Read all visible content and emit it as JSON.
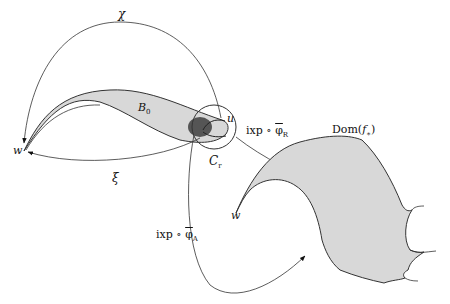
{
  "diagram": {
    "labels": {
      "chi": "χ",
      "xi": "ξ",
      "b0": "B",
      "b0_sub": "0",
      "u": "u",
      "w_left": "w",
      "w_right": "w",
      "cr": "C",
      "cr_sub": "r",
      "ixp_r_prefix": "ixp ∘ ",
      "ixp_r_phi": "φ",
      "ixp_r_sub": "R",
      "ixp_a_prefix": "ixp ∘ ",
      "ixp_a_phi": "φ",
      "ixp_a_sub": "A",
      "dom": "Dom(",
      "dom_f": "f",
      "dom_star": "∗",
      "dom_close": ")"
    },
    "colors": {
      "stroke": "#333333",
      "region_fill": "#d8d8d8",
      "blob_fill": "#555555",
      "background": "#ffffff"
    }
  }
}
